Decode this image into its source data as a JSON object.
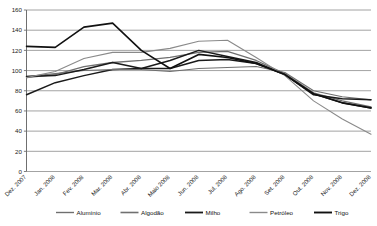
{
  "chart_data": {
    "type": "line",
    "title": "",
    "subtitle": "",
    "xlabel": "",
    "ylabel": "",
    "ylim": [
      0,
      160
    ],
    "yticks": [
      0,
      20,
      40,
      60,
      80,
      100,
      120,
      140,
      160
    ],
    "grid": true,
    "legend_position": "bottom",
    "categories": [
      "Dez. 2007",
      "Jan. 2008",
      "Fev. 2008",
      "Mar. 2008",
      "Abr. 2008",
      "Maio 2008",
      "Jun. 2008",
      "Jul. 2008",
      "Ago. 2008",
      "Set. 2008",
      "Out. 2008",
      "Nov. 2008",
      "Dez. 2008"
    ],
    "series": [
      {
        "name": "Alumínio",
        "color": "#6f6f6f",
        "width": 1.1,
        "values": [
          94,
          97,
          100,
          101,
          101,
          99,
          102,
          103,
          104,
          98,
          80,
          74,
          71
        ]
      },
      {
        "name": "Algodão",
        "color": "#707070",
        "width": 1.3,
        "values": [
          93,
          96,
          104,
          108,
          110,
          113,
          118,
          119,
          110,
          97,
          78,
          70,
          64
        ]
      },
      {
        "name": "Milho",
        "color": "#1a1a1a",
        "width": 1.5,
        "values": [
          94,
          95,
          101,
          108,
          102,
          110,
          120,
          114,
          108,
          96,
          76,
          72,
          71
        ]
      },
      {
        "name": "Petróleo",
        "color": "#8a8a8a",
        "width": 1.1,
        "values": [
          93,
          99,
          112,
          118,
          118,
          122,
          129,
          130,
          113,
          95,
          70,
          52,
          37
        ]
      },
      {
        "name": "Trigo",
        "color": "#111111",
        "width": 1.6,
        "values": [
          124,
          123,
          143,
          147,
          120,
          102,
          116,
          113,
          107,
          96,
          77,
          68,
          63
        ]
      }
    ],
    "baseline_series": {
      "name": "Trigo-start-segment",
      "values": [
        76,
        88,
        95,
        101,
        102,
        102,
        110,
        111,
        107,
        96,
        77,
        68,
        63
      ]
    }
  },
  "legend": {
    "items": [
      {
        "label": "Alumínio",
        "swatch": "line-swatch"
      },
      {
        "label": "Algodão",
        "swatch": "line-swatch"
      },
      {
        "label": "Milho",
        "swatch": "line-swatch"
      },
      {
        "label": "Petróleo",
        "swatch": "line-swatch"
      },
      {
        "label": "Trigo",
        "swatch": "line-swatch"
      }
    ]
  }
}
